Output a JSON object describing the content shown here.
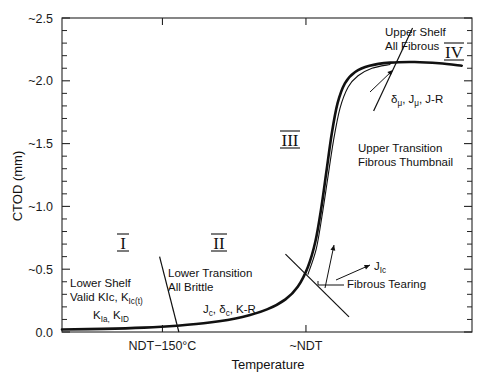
{
  "chart_data": {
    "type": "line",
    "title": "",
    "xlabel": "Temperature",
    "ylabel": "CTOD (mm)",
    "ylim": [
      0.0,
      2.5
    ],
    "yticks": [
      "0.0",
      "~0.5",
      "~1.0",
      "~1.5",
      "~2.0",
      "~2.5"
    ],
    "ytick_values": [
      0.0,
      0.5,
      1.0,
      1.5,
      2.0,
      2.5
    ],
    "minor_ticks_per_interval": 4,
    "xticks": [
      "NDT−150°C",
      "~NDT"
    ],
    "xtick_positions": [
      0.245,
      0.595
    ],
    "grid": false,
    "legend": "none",
    "series": [
      {
        "name": "CTOD transition curve",
        "style": "thick",
        "points": [
          [
            0.0,
            0.02
          ],
          [
            0.1,
            0.025
          ],
          [
            0.2,
            0.035
          ],
          [
            0.28,
            0.05
          ],
          [
            0.36,
            0.075
          ],
          [
            0.44,
            0.12
          ],
          [
            0.5,
            0.18
          ],
          [
            0.545,
            0.26
          ],
          [
            0.575,
            0.36
          ],
          [
            0.6,
            0.52
          ],
          [
            0.618,
            0.72
          ],
          [
            0.632,
            0.98
          ],
          [
            0.645,
            1.28
          ],
          [
            0.658,
            1.58
          ],
          [
            0.672,
            1.82
          ],
          [
            0.69,
            1.98
          ],
          [
            0.715,
            2.07
          ],
          [
            0.75,
            2.12
          ],
          [
            0.8,
            2.145
          ],
          [
            0.86,
            2.15
          ],
          [
            0.92,
            2.14
          ],
          [
            0.975,
            2.12
          ]
        ]
      },
      {
        "name": "Upper transition fibrous thumbnail curve",
        "style": "thin",
        "points": [
          [
            0.6,
            0.46
          ],
          [
            0.62,
            0.66
          ],
          [
            0.634,
            0.92
          ],
          [
            0.648,
            1.22
          ],
          [
            0.662,
            1.52
          ],
          [
            0.678,
            1.78
          ],
          [
            0.698,
            1.95
          ],
          [
            0.722,
            2.04
          ],
          [
            0.756,
            2.1
          ],
          [
            0.8,
            2.13
          ]
        ]
      }
    ],
    "region_dividers": [
      {
        "name": "divider-I-II",
        "x1": 0.238,
        "y1": 0.6,
        "x2": 0.285,
        "y2": 0.0
      },
      {
        "name": "divider-II-III",
        "x1": 0.545,
        "y1": 0.62,
        "x2": 0.7,
        "y2": 0.12
      },
      {
        "name": "divider-III-IV",
        "x1": 0.855,
        "y1": 2.42,
        "x2": 0.76,
        "y2": 1.76
      }
    ]
  },
  "regions": [
    {
      "numeral": "I",
      "label_lines": [
        "Lower Shelf",
        "Valid KIc, K"
      ],
      "sub1": "Ic(t)",
      "line3_main": "K",
      "line3_sub1": "Ia,",
      "line3_main2": " K",
      "line3_sub2": "ID"
    },
    {
      "numeral": "II",
      "label_lines": [
        "Lower Transition",
        "All Brittle"
      ],
      "formula_j": "J",
      "formula_j_sub": "c",
      "formula_delta": ", δ",
      "formula_delta_sub": "c",
      "formula_kr": ", K-R"
    },
    {
      "numeral": "III",
      "label_lines": [
        "Upper Transition",
        "Fibrous Thumbnail"
      ]
    },
    {
      "numeral": "IV",
      "label_lines": [
        "Upper Shelf",
        "All Fibrous"
      ],
      "formula": "δ",
      "formula_sub1": "μ",
      "formula_mid": ", J",
      "formula_sub2": "μ",
      "formula_end": ", J-R"
    }
  ],
  "annotations": {
    "jic_label": "J",
    "jic_sub": "Ic",
    "fibrous_tearing": "Fibrous Tearing",
    "upper_shelf_l1": "Upper Shelf",
    "upper_shelf_l2": "All Fibrous",
    "upper_transition_l1": "Upper Transition",
    "upper_transition_l2": "Fibrous Thumbnail",
    "lower_shelf_l1": "Lower Shelf",
    "lower_shelf_l2": "Valid KIc, K",
    "lower_shelf_l2_sub": "Ic(t)",
    "lower_transition_l1": "Lower Transition",
    "lower_transition_l2": "All Brittle"
  },
  "colors": {
    "curve": "#111111",
    "axis": "#242424",
    "background": "#ffffff",
    "text": "#1a1a1a"
  }
}
